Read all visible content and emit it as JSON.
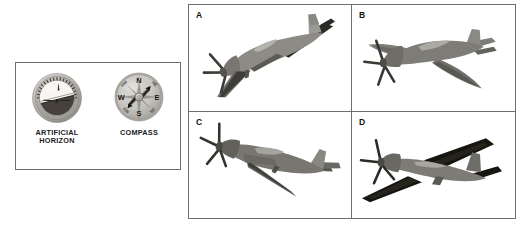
{
  "instrument_panel": {
    "instruments": [
      {
        "id": "artificial-horizon",
        "label_line1": "ARTIFICIAL",
        "label_line2": "HORIZON",
        "type": "attitude-indicator",
        "bezel_color": "#b9b7b2",
        "sky_color": "#f2f0ec",
        "ground_color": "#4a4541",
        "bank_angle_degrees": -14,
        "pointer_position": "top"
      },
      {
        "id": "compass",
        "label_line1": "COMPASS",
        "label_line2": "",
        "type": "magnetic-compass",
        "face_color": "#c5c3bd",
        "cardinal_points": [
          "N",
          "E",
          "S",
          "W"
        ],
        "needle_heading": "NE",
        "needle_color": "#2a2a2a"
      }
    ]
  },
  "aircraft_grid": {
    "panels": [
      {
        "letter": "A",
        "name": "aircraft-a",
        "attitude": "nose-down descending, banked right, viewed from front-left",
        "body_color": "#8d8b86",
        "shadow_color": "#2b2926"
      },
      {
        "letter": "B",
        "name": "aircraft-b",
        "attitude": "level flight, viewed from above and behind",
        "body_color": "#7e7c77",
        "shadow_color": "#4b4946"
      },
      {
        "letter": "C",
        "name": "aircraft-c",
        "attitude": "nose-up climbing, viewed from front-left",
        "body_color": "#78766f",
        "shadow_color": "#3d3b36"
      },
      {
        "letter": "D",
        "name": "aircraft-d",
        "attitude": "banked left turn, viewed from below-front",
        "body_color": "#7d7b76",
        "shadow_color": "#16150f"
      }
    ]
  }
}
